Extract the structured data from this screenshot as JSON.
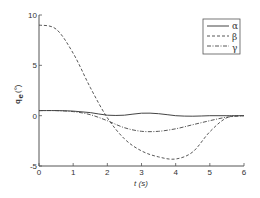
{
  "chart_data": {
    "type": "line",
    "title": "",
    "xlabel": "t (s)",
    "ylabel": "q_e (°)",
    "xlim": [
      0,
      6
    ],
    "ylim": [
      -5,
      10
    ],
    "xticks": [
      0,
      1,
      2,
      3,
      4,
      5,
      6
    ],
    "yticks": [
      -5,
      0,
      5,
      10
    ],
    "grid": false,
    "legend_position": "upper right",
    "x": [
      0,
      0.5,
      1,
      1.5,
      2,
      2.5,
      3,
      3.5,
      4,
      4.5,
      5,
      5.5,
      6
    ],
    "series": [
      {
        "name": "α",
        "style": "solid",
        "values": [
          0.5,
          0.5,
          0.45,
          0.3,
          0.05,
          0.05,
          0.25,
          0.2,
          0.0,
          -0.05,
          0.0,
          0.0,
          0.0
        ]
      },
      {
        "name": "β",
        "style": "dashed",
        "values": [
          9.0,
          8.6,
          6.2,
          2.8,
          -0.2,
          -2.3,
          -3.5,
          -4.1,
          -4.3,
          -3.6,
          -1.6,
          -0.2,
          0.0
        ]
      },
      {
        "name": "γ",
        "style": "dash-dot",
        "values": [
          0.5,
          0.5,
          0.4,
          0.1,
          -0.5,
          -1.2,
          -1.55,
          -1.55,
          -1.3,
          -0.9,
          -0.5,
          -0.15,
          0.0
        ]
      }
    ]
  },
  "labels": {
    "xlabel": "t (s)",
    "ylabel_main": "q",
    "ylabel_sub": "e",
    "ylabel_unit": "(°)",
    "xticks": [
      "0",
      "1",
      "2",
      "3",
      "4",
      "5",
      "6"
    ],
    "yticks": [
      "-5",
      "0",
      "5",
      "10"
    ],
    "legend": [
      "α",
      "β",
      "γ"
    ]
  },
  "colors": {
    "line": "#444444",
    "axis": "#555555",
    "background": "#ffffff"
  }
}
